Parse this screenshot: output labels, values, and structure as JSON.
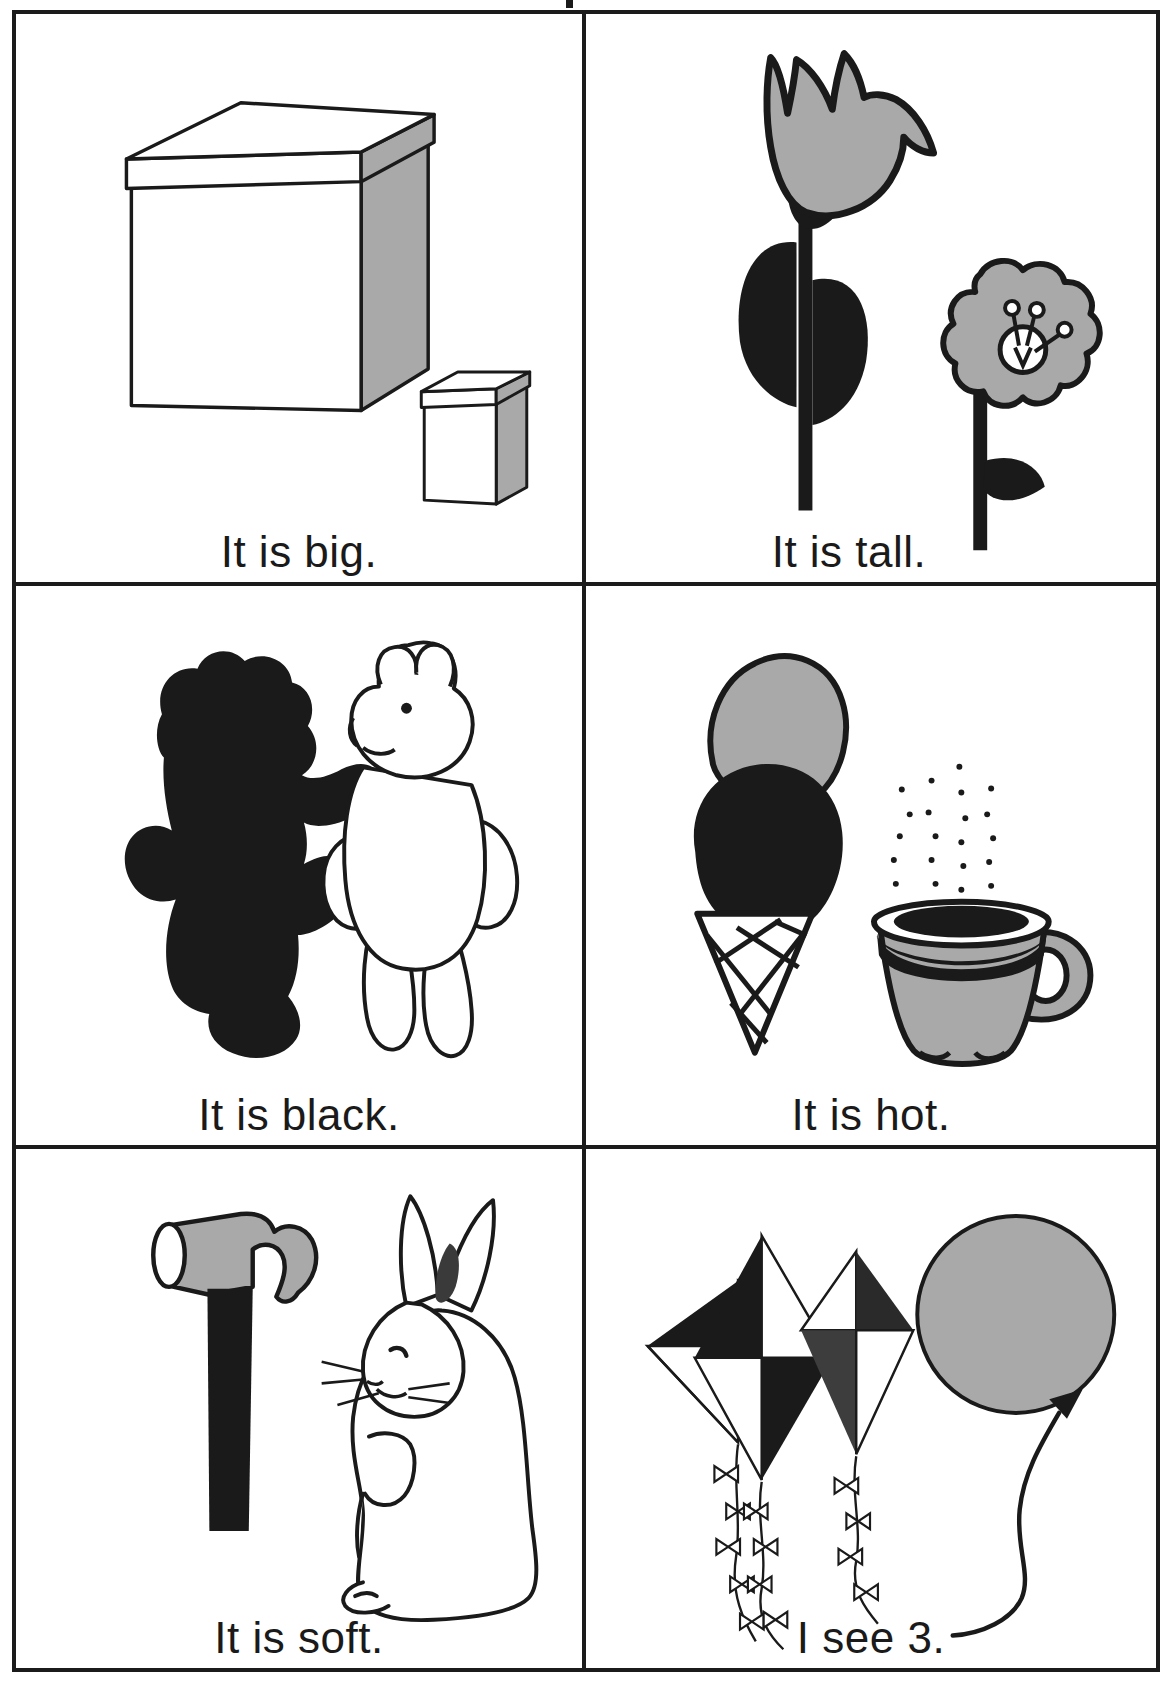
{
  "worksheet": {
    "type": "picture-word-cards",
    "rows": 3,
    "columns": 2,
    "ink_black": "#1a1a1a",
    "ink_gray": "#a6a6a6",
    "paper": "#ffffff"
  },
  "cards": [
    {
      "id": "card-big",
      "caption": "It is big.",
      "illustration": "two-boxes-large-and-small",
      "objects": [
        "large-box-icon",
        "small-box-icon"
      ]
    },
    {
      "id": "card-tall",
      "caption": "It is tall.",
      "illustration": "tall-tulip-and-short-flower",
      "objects": [
        "tulip-icon",
        "short-flower-icon"
      ]
    },
    {
      "id": "card-black",
      "caption": "It is black.",
      "illustration": "black-bear-and-white-bear",
      "objects": [
        "black-teddy-bear-icon",
        "white-teddy-bear-icon"
      ]
    },
    {
      "id": "card-hot",
      "caption": "It is hot.",
      "illustration": "ice-cream-cone-and-steaming-cup",
      "objects": [
        "ice-cream-cone-icon",
        "steaming-teacup-icon"
      ]
    },
    {
      "id": "card-soft",
      "caption": "It is soft.",
      "illustration": "hammer-and-rabbit",
      "objects": [
        "hammer-icon",
        "rabbit-icon"
      ]
    },
    {
      "id": "card-see-3",
      "caption": "I see 3.",
      "illustration": "three-kites-and-one-balloon",
      "objects": [
        "kite-icon",
        "kite-icon",
        "kite-icon",
        "balloon-icon"
      ],
      "counted_quantity": 3
    }
  ]
}
